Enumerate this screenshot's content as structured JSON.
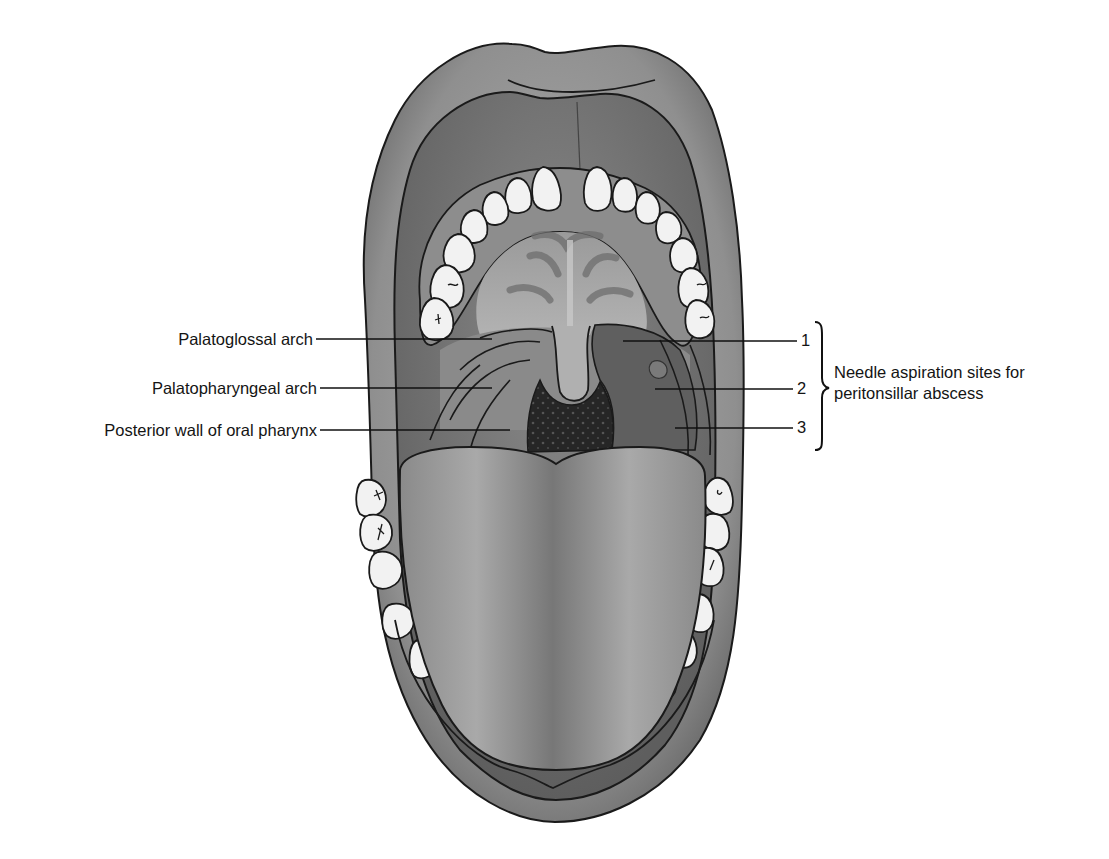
{
  "figure": {
    "colors": {
      "background": "#ffffff",
      "outline": "#1a1a1a",
      "lip": "#8e8e8e",
      "lip_highlight": "#c4c4c4",
      "oral_mucosa": "#7a7a7a",
      "palate": "#a3a3a3",
      "palate_ridges": "#6e6e6e",
      "teeth": "#f2f2f2",
      "tongue": "#9c9c9c",
      "tongue_midline": "#6f6f6f",
      "pharynx": "#2a2a2a",
      "tonsil_area": "#5c5c5c"
    }
  },
  "labels": {
    "left": [
      {
        "text": "Palatoglossal arch",
        "line_y": 339
      },
      {
        "text": "Palatopharyngeal arch",
        "line_y": 388
      },
      {
        "text": "Posterior wall of oral pharynx",
        "line_y": 430
      }
    ],
    "right": [
      {
        "number": "1",
        "line_y": 341
      },
      {
        "number": "2",
        "line_y": 389
      },
      {
        "number": "3",
        "line_y": 428
      }
    ],
    "bracket_caption": {
      "line1": "Needle aspiration sites for",
      "line2": "peritonsillar abscess"
    }
  }
}
